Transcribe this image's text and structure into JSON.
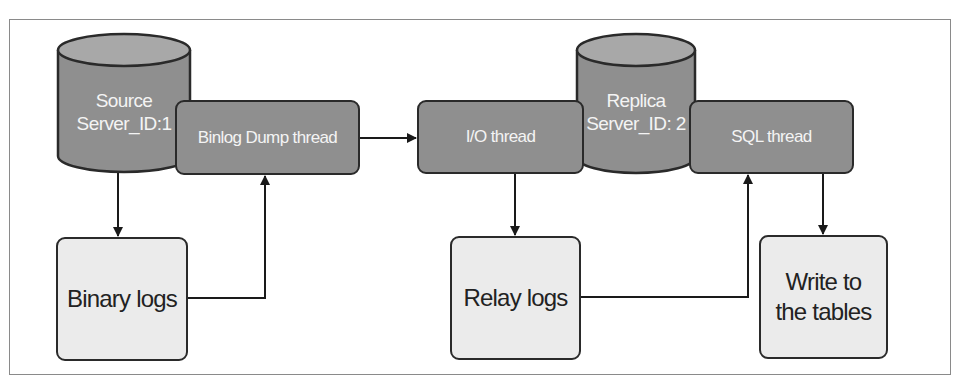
{
  "diagram": {
    "source": {
      "line1": "Source",
      "line2": "Server_ID:1"
    },
    "replica": {
      "line1": "Replica",
      "line2": "Server_ID: 2"
    },
    "binlog_dump_thread": "Binlog Dump thread",
    "io_thread": "I/O thread",
    "sql_thread": "SQL thread",
    "binary_logs": "Binary logs",
    "relay_logs": "Relay logs",
    "write_tables": {
      "line1": "Write to",
      "line2": "the tables"
    },
    "colors": {
      "dark_fill": "#8f8f8f",
      "light_fill": "#ebebeb",
      "stroke": "#2a2a2a",
      "frame": "#8a8a8a"
    }
  }
}
